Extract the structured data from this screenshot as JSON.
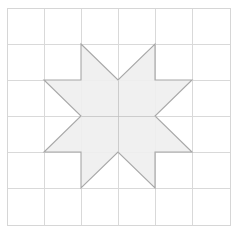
{
  "figure": {
    "title": "Eight-Pointed Star Quilt Block",
    "description": "A light gray eight-pointed star centered on a six-by-six square grid with a thin outer border.",
    "canvas": {
      "width": 238,
      "height": 233,
      "background_color": "#ffffff"
    },
    "grid": {
      "name": "square-grid",
      "columns": 6,
      "rows": 6,
      "line_color": "#d9d9d9",
      "border_color": "#d6d6d6",
      "x_positions": [
        7,
        44,
        81,
        118,
        155,
        192,
        230
      ],
      "y_positions": [
        8,
        44,
        80,
        116,
        152,
        188,
        225
      ],
      "cell_width": 37,
      "cell_height": 36
    },
    "star": {
      "name": "eight-pointed-star",
      "points": 8,
      "fill_color": "#efefef",
      "stroke_color": "#a8a8a8",
      "stroke_width": 1.1,
      "center": [
        118,
        116
      ],
      "outline_path": "M 81,44 L 118,80 L 155,44 L 155,80 L 192,80 L 155,116 L 192,152 L 155,152 L 155,188 L 118,152 L 81,188 L 81,152 L 44,152 L 81,116 L 44,80 L 81,80 Z",
      "vertices": [
        [
          81,
          44
        ],
        [
          118,
          80
        ],
        [
          155,
          44
        ],
        [
          155,
          80
        ],
        [
          192,
          80
        ],
        [
          155,
          116
        ],
        [
          192,
          152
        ],
        [
          155,
          152
        ],
        [
          155,
          188
        ],
        [
          118,
          152
        ],
        [
          81,
          188
        ],
        [
          81,
          152
        ],
        [
          44,
          152
        ],
        [
          81,
          116
        ],
        [
          44,
          80
        ],
        [
          81,
          80
        ]
      ],
      "tips": {
        "top_left": [
          81,
          44
        ],
        "top_right": [
          155,
          44
        ],
        "right_top": [
          192,
          80
        ],
        "right_bottom": [
          192,
          152
        ],
        "bottom_right": [
          155,
          188
        ],
        "bottom_left": [
          81,
          188
        ],
        "left_bottom": [
          44,
          152
        ],
        "left_top": [
          44,
          80
        ]
      },
      "inner_seam_lines": [
        {
          "name": "seam-vertical",
          "x1": 118,
          "y1": 80,
          "x2": 118,
          "y2": 152
        },
        {
          "name": "seam-horizontal",
          "x1": 81,
          "y1": 116,
          "x2": 155,
          "y2": 116
        }
      ]
    }
  }
}
